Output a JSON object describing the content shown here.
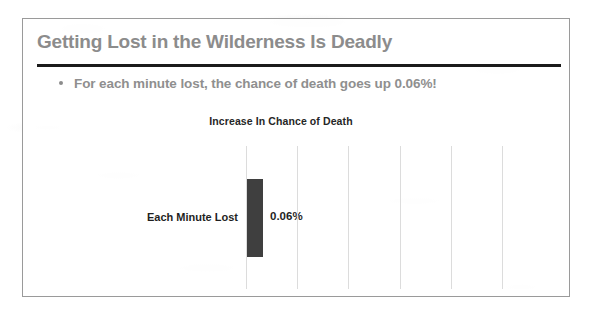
{
  "slide": {
    "title": "Getting Lost in the Wilderness Is Deadly",
    "bullets": [
      "For each minute lost, the chance of death goes up 0.06%!"
    ]
  },
  "colors": {
    "title_gray": "#8c8c8c",
    "bullet_gray": "#8f8f8f",
    "rule_black": "#1b1b1b",
    "bar_dark_gray": "#3f3f3f",
    "gridline_gray": "#dcdcdc",
    "border_gray": "#9a9a9a",
    "label_black": "#1f1f1f"
  },
  "chart_data": {
    "type": "bar",
    "orientation": "vertical",
    "title": "Increase In Chance of Death",
    "categories": [
      "Each Minute Lost"
    ],
    "values": [
      0.06
    ],
    "value_labels": [
      "0.06%"
    ],
    "series": [
      {
        "name": "Increase In Chance of Death",
        "values": [
          0.06
        ]
      }
    ],
    "xlabel": "",
    "ylabel": "",
    "unit": "%",
    "grid": true,
    "gridline_count": 6,
    "legend": false,
    "axis_labels_visible": false
  }
}
